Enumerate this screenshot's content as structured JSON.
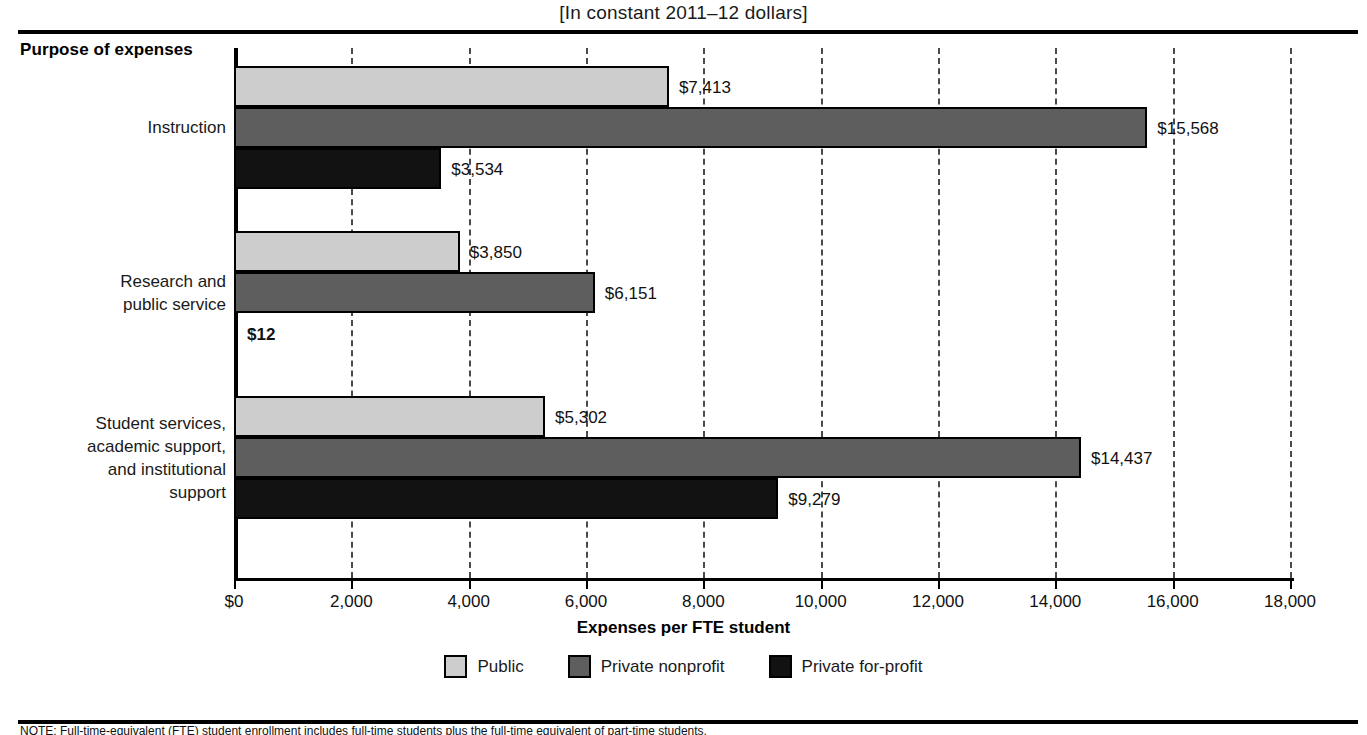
{
  "subtitle": "[In constant 2011–12 dollars]",
  "row_header": "Purpose of expenses",
  "axis_title": "Expenses per FTE student",
  "note": "NOTE: Full-time-equivalent (FTE) student enrollment includes full-time students plus the full-time equivalent of part-time students.",
  "legend": [
    {
      "label": "Public",
      "color": "#cdcdcd"
    },
    {
      "label": "Private nonprofit",
      "color": "#5e5e5e"
    },
    {
      "label": "Private for-profit",
      "color": "#121212"
    }
  ],
  "axis_ticks": [
    {
      "label": "$0",
      "value": 0
    },
    {
      "label": "2,000",
      "value": 2000
    },
    {
      "label": "4,000",
      "value": 4000
    },
    {
      "label": "6,000",
      "value": 6000
    },
    {
      "label": "8,000",
      "value": 8000
    },
    {
      "label": "10,000",
      "value": 10000
    },
    {
      "label": "12,000",
      "value": 12000
    },
    {
      "label": "14,000",
      "value": 14000
    },
    {
      "label": "16,000",
      "value": 16000
    },
    {
      "label": "18,000",
      "value": 18000
    }
  ],
  "chart_data": {
    "type": "bar",
    "orientation": "horizontal",
    "title": "",
    "subtitle": "[In constant 2011–12 dollars]",
    "xlabel": "Expenses per FTE student",
    "ylabel": "Purpose of expenses",
    "xlim": [
      0,
      18000
    ],
    "xtick_step": 2000,
    "grid": true,
    "grid_axis": "x",
    "legend_position": "bottom",
    "categories": [
      "Instruction",
      "Research and\npublic service",
      "Student services,\nacademic support,\nand institutional\nsupport"
    ],
    "series": [
      {
        "name": "Public",
        "color": "#cdcdcd",
        "values": [
          7413,
          3850,
          5302
        ],
        "labels": [
          "$7,413",
          "$3,850",
          "$12"
        ]
      },
      {
        "name": "Private nonprofit",
        "color": "#5e5e5e",
        "values": [
          15568,
          6151,
          14437
        ],
        "labels": [
          "$15,568",
          "$6,151",
          "$14,437"
        ]
      },
      {
        "name": "Private for-profit",
        "color": "#121212",
        "values": [
          3534,
          12,
          9279
        ],
        "labels": [
          "$3,534",
          "$12",
          "$9,279"
        ]
      }
    ],
    "bars": [
      {
        "category": "Instruction",
        "series": "Public",
        "value": 7413,
        "label": "$7,413"
      },
      {
        "category": "Instruction",
        "series": "Private nonprofit",
        "value": 15568,
        "label": "$15,568"
      },
      {
        "category": "Instruction",
        "series": "Private for-profit",
        "value": 3534,
        "label": "$3,534"
      },
      {
        "category": "Research and public service",
        "series": "Public",
        "value": 3850,
        "label": "$3,850"
      },
      {
        "category": "Research and public service",
        "series": "Private nonprofit",
        "value": 6151,
        "label": "$6,151"
      },
      {
        "category": "Research and public service",
        "series": "Private for-profit",
        "value": 12,
        "label": "$12"
      },
      {
        "category": "Student services, academic support, and institutional support",
        "series": "Public",
        "value": 5302,
        "label": "$5,302"
      },
      {
        "category": "Student services, academic support, and institutional support",
        "series": "Private nonprofit",
        "value": 14437,
        "label": "$14,437"
      },
      {
        "category": "Student services, academic support, and institutional support",
        "series": "Private for-profit",
        "value": 9279,
        "label": "$9,279"
      }
    ]
  }
}
